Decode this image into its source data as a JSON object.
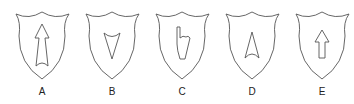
{
  "figure": {
    "stroke_color": "#555555",
    "options": [
      {
        "label": "A",
        "symbol": "long-arrow-up-icon"
      },
      {
        "label": "B",
        "symbol": "downward-triangle-icon"
      },
      {
        "label": "C",
        "symbol": "pointing-hand-icon"
      },
      {
        "label": "D",
        "symbol": "arrowhead-up-icon"
      },
      {
        "label": "E",
        "symbol": "block-arrow-up-icon"
      }
    ]
  }
}
